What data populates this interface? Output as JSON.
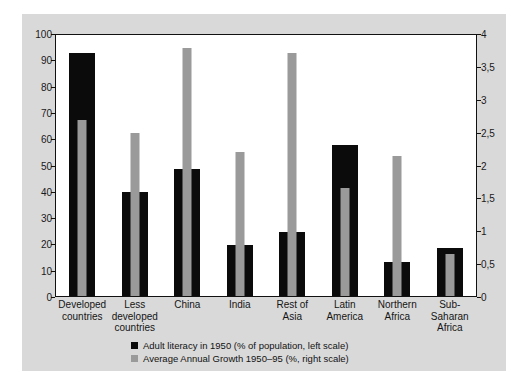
{
  "chart_data": {
    "type": "bar",
    "title": "",
    "xlabel": "",
    "categories": [
      "Developed countries",
      "Less developed countries",
      "China",
      "India",
      "Rest of Asia",
      "Latin America",
      "Northern Africa",
      "Sub-Saharan Africa"
    ],
    "category_lines": [
      [
        "Developed",
        "countries"
      ],
      [
        "Less",
        "developed",
        "countries"
      ],
      [
        "China"
      ],
      [
        "India"
      ],
      [
        "Rest of",
        "Asia"
      ],
      [
        "Latin",
        "America"
      ],
      [
        "Northern",
        "Africa"
      ],
      [
        "Sub-Saharan",
        "Africa"
      ]
    ],
    "series": [
      {
        "name": "Adult literacy in 1950 (% of population, left scale)",
        "axis": "left",
        "color": "#0b0b0b",
        "values": [
          93,
          40,
          48.5,
          19.5,
          24.5,
          58,
          13,
          18.5
        ]
      },
      {
        "name": "Average Annual Growth 1950–95 (%, right scale)",
        "axis": "right",
        "color": "#9a9a9a",
        "values": [
          2.7,
          2.5,
          3.8,
          2.2,
          3.72,
          1.65,
          2.15,
          0.65
        ]
      }
    ],
    "left_axis": {
      "label": "",
      "ylim": [
        0,
        100
      ],
      "ticks": [
        "0",
        "10",
        "20",
        "30",
        "40",
        "50",
        "60",
        "70",
        "80",
        "90",
        "100"
      ],
      "tick_values": [
        0,
        10,
        20,
        30,
        40,
        50,
        60,
        70,
        80,
        90,
        100
      ]
    },
    "right_axis": {
      "label": "",
      "ylim": [
        0,
        4
      ],
      "ticks": [
        "0",
        "0,5",
        "1",
        "1,5",
        "2",
        "2,5",
        "3",
        "3,5",
        "4"
      ],
      "tick_values": [
        0,
        0.5,
        1,
        1.5,
        2,
        2.5,
        3,
        3.5,
        4
      ]
    },
    "grid": false,
    "legend_position": "bottom-center",
    "legend": [
      {
        "marker": "black-square",
        "label": "Adult literacy in 1950 (% of population, left scale)"
      },
      {
        "marker": "gray-square",
        "label": "Average Annual Growth 1950–95 (%, right scale)"
      }
    ],
    "colors": {
      "panel_background": "#d9d9d9",
      "plot_background": "#ffffff",
      "axis": "#111111",
      "series_black": "#0b0b0b",
      "series_gray": "#9a9a9a"
    }
  }
}
